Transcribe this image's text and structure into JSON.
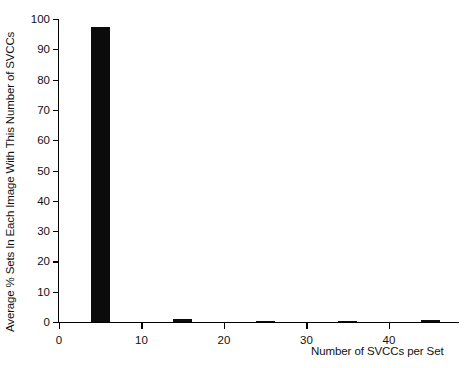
{
  "chart_data": {
    "type": "bar",
    "title": "",
    "xlabel": "Number of SVCCs per Set",
    "ylabel": "Average % Sets In Each Image With This Number of SVCCs",
    "x": [
      5,
      15,
      25,
      35,
      45
    ],
    "values": [
      97.5,
      1.0,
      0.5,
      0.4,
      0.6
    ],
    "bar_width": 2.3,
    "xlim": [
      0,
      48.5
    ],
    "ylim": [
      0,
      100
    ],
    "xticks": [
      0,
      10,
      20,
      30,
      40
    ],
    "xtick_labels": [
      "0",
      "10",
      "20",
      "30",
      "40"
    ],
    "yticks": [
      0,
      10,
      20,
      30,
      40,
      50,
      60,
      70,
      80,
      90,
      100
    ],
    "ytick_labels": [
      "0",
      "10",
      "20",
      "30",
      "40",
      "50",
      "60",
      "70",
      "80",
      "90",
      "100"
    ],
    "grid": false,
    "legend": null,
    "bar_color": "#0b0b0b",
    "axis_color": "#000000",
    "background_color": "#ffffff"
  }
}
